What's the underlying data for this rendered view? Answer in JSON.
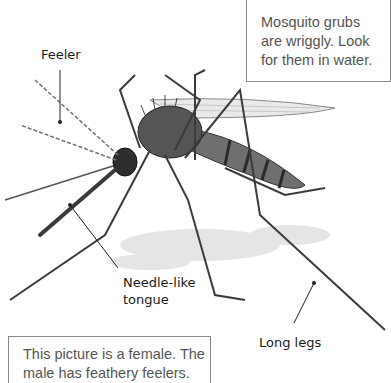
{
  "figure": {
    "labels": {
      "feeler": "Feeler",
      "tongue_line1": "Needle-like",
      "tongue_line2": "tongue",
      "legs": "Long legs"
    },
    "callouts": {
      "top_right": {
        "lines": [
          "Mosquito grubs",
          "are wriggly. Look",
          "for them in water."
        ]
      },
      "bottom_left": {
        "lines": [
          "This picture is a female. The",
          "male has feathery feelers."
        ]
      }
    }
  }
}
